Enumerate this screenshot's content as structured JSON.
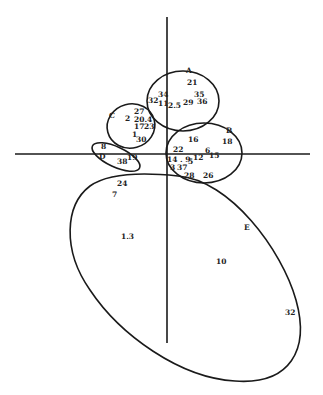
{
  "diagram": {
    "width": 323,
    "height": 395,
    "colors": {
      "line": "#1a1a1a",
      "text": "#222222",
      "background": "#ffffff"
    },
    "axes": {
      "horizontal": {
        "x1": 15,
        "y1": 154,
        "x2": 310,
        "y2": 154
      },
      "vertical": {
        "x1": 167,
        "y1": 17,
        "x2": 167,
        "y2": 343
      }
    },
    "clusters": [
      {
        "id": "A",
        "label": "A",
        "cx": 183,
        "cy": 101,
        "rx": 36,
        "ry": 30,
        "rotate": 0,
        "label_x": 186,
        "label_y": 73
      },
      {
        "id": "B",
        "label": "B",
        "cx": 204,
        "cy": 153,
        "rx": 38,
        "ry": 30,
        "rotate": 0,
        "label_x": 226,
        "label_y": 133
      },
      {
        "id": "C",
        "label": "C",
        "cx": 131,
        "cy": 126,
        "rx": 24,
        "ry": 22,
        "rotate": -15,
        "label_x": 109,
        "label_y": 118
      },
      {
        "id": "D",
        "label": "D",
        "cx": 116,
        "cy": 157,
        "rx": 26,
        "ry": 10,
        "rotate": 25,
        "label_x": 99,
        "label_y": 159
      },
      {
        "id": "E",
        "label": "E",
        "path": "M 178 176 C 230 180 282 250 296 300 C 310 350 290 385 235 381 C 180 378 120 335 90 290 C 62 250 65 205 90 186 C 110 172 150 173 178 176 Z",
        "label_x": 244,
        "label_y": 230
      }
    ],
    "points": [
      {
        "text": "21",
        "x": 187,
        "y": 85
      },
      {
        "text": "34",
        "x": 158,
        "y": 97
      },
      {
        "text": "35",
        "x": 194,
        "y": 97
      },
      {
        "text": "32",
        "x": 148,
        "y": 103
      },
      {
        "text": "11",
        "x": 158,
        "y": 106
      },
      {
        "text": "2.5",
        "x": 168,
        "y": 108
      },
      {
        "text": "29",
        "x": 183,
        "y": 105
      },
      {
        "text": "36",
        "x": 197,
        "y": 104
      },
      {
        "text": "27",
        "x": 134,
        "y": 114
      },
      {
        "text": "2",
        "x": 125,
        "y": 121
      },
      {
        "text": "20.4",
        "x": 134,
        "y": 122
      },
      {
        "text": "17",
        "x": 134,
        "y": 129
      },
      {
        "text": "23",
        "x": 144,
        "y": 129
      },
      {
        "text": "1",
        "x": 132,
        "y": 137
      },
      {
        "text": "30",
        "x": 136,
        "y": 142
      },
      {
        "text": "8",
        "x": 101,
        "y": 149
      },
      {
        "text": "38",
        "x": 117,
        "y": 164
      },
      {
        "text": "19",
        "x": 127,
        "y": 160
      },
      {
        "text": "16",
        "x": 188,
        "y": 142
      },
      {
        "text": "18",
        "x": 222,
        "y": 144
      },
      {
        "text": "22",
        "x": 173,
        "y": 152
      },
      {
        "text": "6",
        "x": 205,
        "y": 153
      },
      {
        "text": "12",
        "x": 193,
        "y": 160
      },
      {
        "text": "15",
        "x": 209,
        "y": 158
      },
      {
        "text": "14 . 9",
        "x": 167,
        "y": 162
      },
      {
        "text": "5",
        "x": 188,
        "y": 164
      },
      {
        "text": "3",
        "x": 170,
        "y": 170
      },
      {
        "text": "37",
        "x": 177,
        "y": 170
      },
      {
        "text": "28",
        "x": 184,
        "y": 178
      },
      {
        "text": "26",
        "x": 203,
        "y": 178
      },
      {
        "text": "24",
        "x": 117,
        "y": 186
      },
      {
        "text": "7",
        "x": 112,
        "y": 197
      },
      {
        "text": "1.3",
        "x": 121,
        "y": 239
      },
      {
        "text": "10",
        "x": 216,
        "y": 264
      },
      {
        "text": "32",
        "x": 285,
        "y": 315
      }
    ]
  }
}
